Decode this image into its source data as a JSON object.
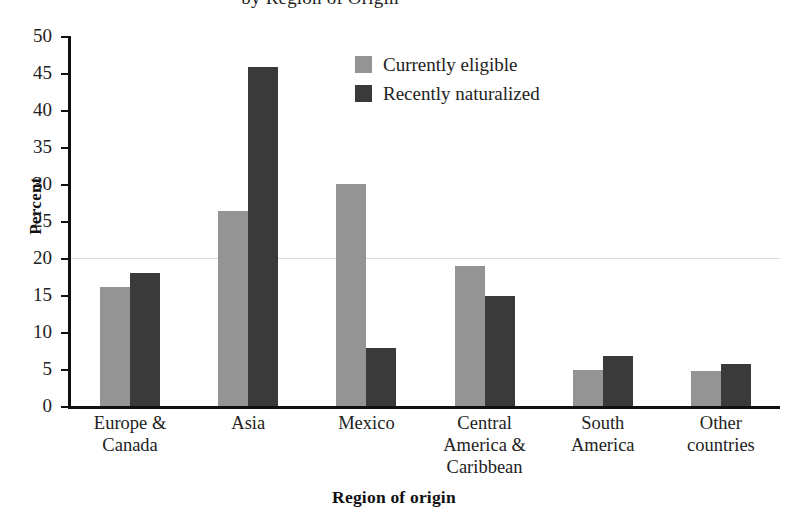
{
  "chart_data": {
    "type": "bar",
    "title": "by Region of Origin",
    "xlabel": "Region of origin",
    "ylabel": "Percent",
    "ylim": [
      0,
      50
    ],
    "yticks": [
      0,
      5,
      10,
      15,
      20,
      25,
      30,
      35,
      40,
      45,
      50
    ],
    "ytick_labels": [
      "0",
      "5",
      "10",
      "15",
      "20",
      "25",
      "30",
      "35",
      "40",
      "45",
      "50"
    ],
    "grid": "single faint horizontal line at 20",
    "gridlines": [
      20
    ],
    "legend_position": "upper center",
    "categories": [
      "Europe &\nCanada",
      "Asia",
      "Mexico",
      "Central\nAmerica &\nCaribbean",
      "South\nAmerica",
      "Other\ncountries"
    ],
    "category_lines": [
      [
        "Europe &",
        "Canada"
      ],
      [
        "Asia"
      ],
      [
        "Mexico"
      ],
      [
        "Central",
        "America &",
        "Caribbean"
      ],
      [
        "South",
        "America"
      ],
      [
        "Other",
        "countries"
      ]
    ],
    "series": [
      {
        "name": "Currently eligible",
        "color": "#949494",
        "values": [
          16.1,
          26.3,
          30.0,
          18.9,
          4.9,
          4.7
        ]
      },
      {
        "name": "Recently naturalized",
        "color": "#3a3a3a",
        "values": [
          18.0,
          45.8,
          7.8,
          14.9,
          6.8,
          5.7
        ]
      }
    ]
  },
  "legend": {
    "items": [
      {
        "label": "Currently eligible",
        "color": "#949494"
      },
      {
        "label": "Recently naturalized",
        "color": "#3a3a3a"
      }
    ]
  }
}
